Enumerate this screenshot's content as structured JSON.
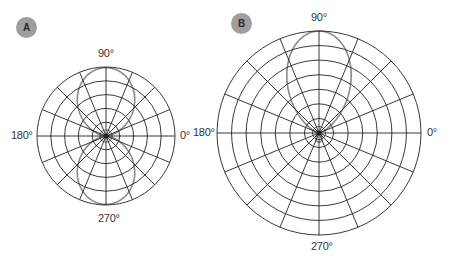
{
  "panels": [
    {
      "id": "A",
      "badge": "A",
      "labels": {
        "deg0": "0°",
        "deg90": "90°",
        "deg180": "180°",
        "deg270": "270°"
      },
      "grid": {
        "rings": 5,
        "spokes": 16
      },
      "pattern": "figure-eight (bidirectional) lobes along 90°–270° axis"
    },
    {
      "id": "B",
      "badge": "B",
      "labels": {
        "deg0": "0°",
        "deg90": "90°",
        "deg180": "180°",
        "deg270": "270°"
      },
      "grid": {
        "rings": 7,
        "spokes": 16
      },
      "pattern": "narrow directional main lobe toward 90° with small back lobe"
    }
  ],
  "colors": {
    "grid": "#222222",
    "lobe": "#8a8a8a",
    "badge": "#9e9e9e"
  }
}
